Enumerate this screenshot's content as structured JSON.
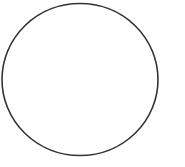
{
  "canvas": {
    "width": 185,
    "height": 167,
    "background": "#ffffff"
  },
  "shapes": [
    {
      "type": "circle",
      "cx": 80,
      "cy": 79.5,
      "rx": 78,
      "ry": 76,
      "stroke": "#333333",
      "stroke_width": 1.6,
      "fill": "none"
    }
  ]
}
